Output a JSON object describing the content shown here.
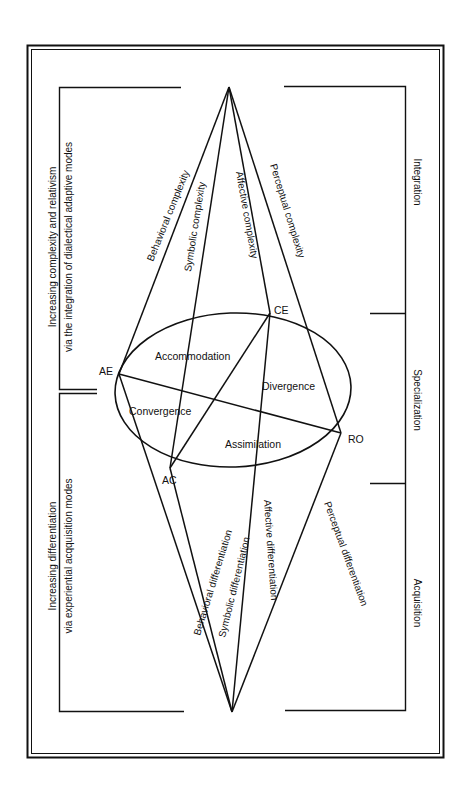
{
  "diagram": {
    "type": "experiential learning / development cone",
    "colors": {
      "ink": "#111111",
      "background": "#ffffff"
    },
    "left_brackets": {
      "top": {
        "line1": "Increasing complexity and relativism",
        "line2": "via the integration of dialectical adaptive modes"
      },
      "bottom": {
        "line1": "Increasing differentiation",
        "line2": "via experiential acqquisition modes"
      }
    },
    "right_brackets": {
      "integration": "Integration",
      "specialization": "Specialization",
      "acquisition": "Acquisition"
    },
    "poles": {
      "ae": "AE",
      "ce": "CE",
      "ro": "RO",
      "ac": "AC"
    },
    "quadrants": {
      "accommodation": "Accommodation",
      "divergence": "Divergence",
      "convergence": "Convergence",
      "assimilation": "Assimilation"
    },
    "upper_cone": {
      "behavioral": "Behavioral complexity",
      "symbolic": "Symbolic complexity",
      "affective": "Affective complexity",
      "perceptual": "Perceptual complexity"
    },
    "lower_cone": {
      "behavioral": "Behavioral differentiation",
      "symbolic": "Symbolic differentiation",
      "affective": "Affective differentiation",
      "perceptual": "Perceptual differentiation"
    }
  }
}
